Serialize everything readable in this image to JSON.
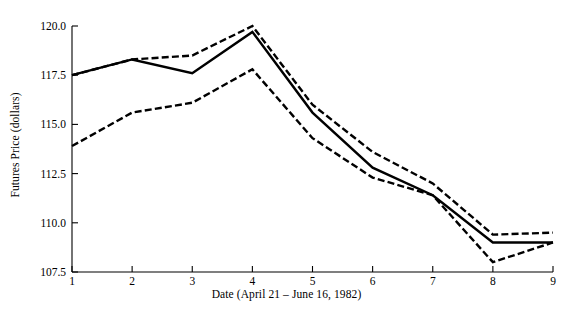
{
  "chart_data": {
    "type": "line",
    "title": "",
    "xlabel": "Date (April 21 – June 16, 1982)",
    "ylabel": "Futures Price (dollars)",
    "x": [
      1,
      2,
      3,
      4,
      5,
      6,
      7,
      8,
      9
    ],
    "xticklabels": [
      "1",
      "2",
      "3",
      "4",
      "5",
      "6",
      "7",
      "8",
      "9"
    ],
    "yticklabels": [
      "120.0",
      "117.5",
      "115.0",
      "112.5",
      "110.0",
      "107.5"
    ],
    "yticks": [
      120.0,
      117.5,
      115.0,
      112.5,
      110.0,
      107.5
    ],
    "xlim": [
      1,
      9
    ],
    "ylim": [
      107.5,
      120.0
    ],
    "grid": false,
    "legend": "none",
    "series": [
      {
        "name": "Upper bound",
        "style": "dashed",
        "color": "#000000",
        "values": [
          117.5,
          118.3,
          118.5,
          120.0,
          116.0,
          113.6,
          112.0,
          109.4,
          109.5
        ]
      },
      {
        "name": "Actual price",
        "style": "solid",
        "color": "#000000",
        "values": [
          117.5,
          118.3,
          117.6,
          119.7,
          115.6,
          112.8,
          111.4,
          109.0,
          109.0
        ]
      },
      {
        "name": "Lower bound",
        "style": "dashed",
        "color": "#000000",
        "values": [
          113.9,
          115.6,
          116.1,
          117.8,
          114.3,
          112.3,
          111.4,
          108.0,
          109.0
        ]
      }
    ]
  }
}
